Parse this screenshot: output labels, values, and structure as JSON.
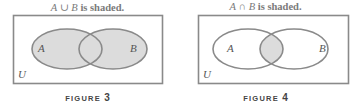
{
  "figures": [
    {
      "id": "figure-3",
      "title_set_a": "A",
      "title_operator": "∪",
      "title_set_b": "B",
      "title_suffix": "is shaded.",
      "shading": "union",
      "labels": {
        "a": "A",
        "b": "B",
        "universe": "U"
      },
      "caption_word": "FIGURE",
      "caption_number": "3"
    },
    {
      "id": "figure-4",
      "title_set_a": "A",
      "title_operator": "∩",
      "title_set_b": "B",
      "title_suffix": "is shaded.",
      "shading": "intersection",
      "labels": {
        "a": "A",
        "b": "B",
        "universe": "U"
      },
      "caption_word": "FIGURE",
      "caption_number": "4"
    }
  ],
  "colors": {
    "stroke": "#8a8a8a",
    "shade": "#dcdcdc",
    "background": "#ffffff",
    "title_text": "#7a7a7a"
  }
}
